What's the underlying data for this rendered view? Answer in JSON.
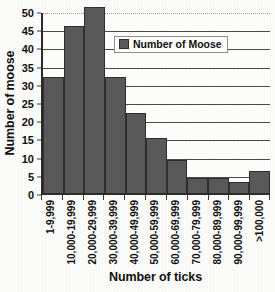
{
  "chart_data": {
    "type": "bar",
    "title": "",
    "xlabel": "Number of ticks",
    "ylabel": "Number of moose",
    "categories": [
      "1-9,999",
      "10,000-19,999",
      "20,000-29,999",
      "30,000-39,999",
      "40,000-49,999",
      "50,000-59,999",
      "60,000-69,999",
      "70,000-79,999",
      "80,000-89,999",
      "90,000-99,999",
      ">100,000"
    ],
    "values": [
      32,
      46,
      51,
      32,
      22,
      15,
      9,
      4,
      4,
      3,
      6
    ],
    "series": [
      {
        "name": "Number of Moose",
        "values": [
          32,
          46,
          51,
          32,
          22,
          15,
          9,
          4,
          4,
          3,
          6
        ],
        "color": "#595959"
      }
    ],
    "ylim": [
      0,
      50
    ],
    "ytick_values": [
      0,
      5,
      10,
      15,
      20,
      25,
      30,
      35,
      40,
      45,
      50
    ],
    "ytick_labels": [
      "0",
      "5",
      "10",
      "15",
      "20",
      "25",
      "30",
      "35",
      "40",
      "45",
      "50"
    ],
    "ystep": 5,
    "grid": "horizontal",
    "xtick_rotation": 90,
    "bar_gap": 0,
    "legend": {
      "position": "upper-right-inside",
      "entries": [
        {
          "label": "Number of Moose",
          "color": "#595959"
        }
      ]
    },
    "colors": {
      "bar_fill": "#595959",
      "bar_border": "#2f2f2f",
      "axis": "#2b2b2b",
      "gridline": "#4a4a4a",
      "background": "#fdfdfc",
      "text": "#111111"
    }
  }
}
